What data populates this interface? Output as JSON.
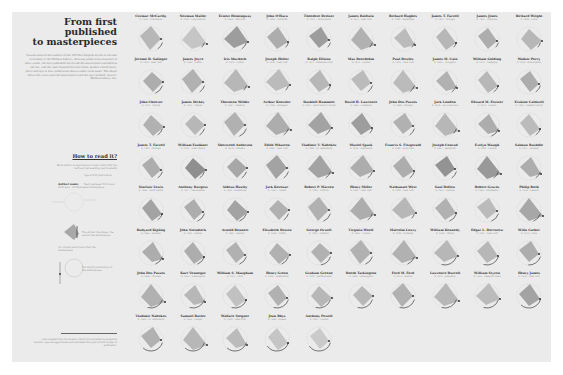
{
  "sidebar": {
    "title": [
      "From first",
      "published",
      "to masterpieces"
    ],
    "intro": "Visualization of the authors of the 100 best English novels of all time according to the Modern Library, showing publication sequence of their works, the first published novel and the masterpiece included in the list, and the time elapsed between them. Author's birth dates, place and age at first publication shown under each name. The shape shows the years until the masterpiece and the age reached. Source: Modern Library list.",
    "how_to_read": "How to read it?",
    "legend": {
      "caption": "Each author is depicted by a radar chart with the vertices representing key moments",
      "author_name_label": "Author name",
      "author_sub_label": "birth year · birthplace",
      "age_label": "Age at first publication",
      "years_label": "Years between first novel and masterpiece",
      "shape_caption": "The darker the shape, the earlier the masterpiece",
      "arc_caption": "Arc shows years lived after the masterpiece",
      "dot_caption": "Dot marks publication of the masterpiece"
    },
    "footnote": "Data compiled from the Modern Library list and public biographical records. Ages are approximate and calculated from year of birth to year of publication."
  },
  "colors": {
    "background": "#ffffff",
    "panel": "#ebebeb",
    "shape_light": "#c9c9c9",
    "shape_dark": "#8f8f8f",
    "line": "#555555",
    "text": "#333333",
    "muted": "#8a8a8a"
  },
  "authors": [
    {
      "name": "Cormac McCarthy",
      "sub": "b. 1933 · Providence",
      "shade": 0.35,
      "arc": 0.15
    },
    {
      "name": "Norman Mailer",
      "sub": "b. 1923 · Long Branch",
      "shade": 0.2,
      "arc": 0.1
    },
    {
      "name": "Ernest Hemingway",
      "sub": "b. 1899 · Oak Park",
      "shade": 0.6,
      "arc": 0.15
    },
    {
      "name": "John O'Hara",
      "sub": "b. 1905 · Pottsville",
      "shade": 0.45,
      "arc": 0.1
    },
    {
      "name": "Theodore Dreiser",
      "sub": "b. 1871 · Terre Haute",
      "shade": 0.6,
      "arc": 0.1
    },
    {
      "name": "James Baldwin",
      "sub": "b. 1924 · New York",
      "shade": 0.4,
      "arc": 0.1
    },
    {
      "name": "Richard Hughes",
      "sub": "b. 1900 · Weybridge",
      "shade": 0.3,
      "arc": 0.1
    },
    {
      "name": "James T. Farrell",
      "sub": "b. 1904 · Chicago",
      "shade": 0.35,
      "arc": 0.1
    },
    {
      "name": "James Jones",
      "sub": "b. 1921 · Robinson",
      "shade": 0.45,
      "arc": 0.1
    },
    {
      "name": "Richard Wright",
      "sub": "b. 1908 · Roxie",
      "shade": 0.35,
      "arc": 0.1
    },
    {
      "name": "Jerome D. Salinger",
      "sub": "b. 1919 · New York",
      "shade": 0.45,
      "arc": 0.2
    },
    {
      "name": "James Joyce",
      "sub": "b. 1882 · Dublin",
      "shade": 0.4,
      "arc": 0.15
    },
    {
      "name": "Iris Murdoch",
      "sub": "b. 1919 · Dublin",
      "shade": 0.35,
      "arc": 0.1
    },
    {
      "name": "Joseph Heller",
      "sub": "b. 1923 · New York",
      "shade": 0.3,
      "arc": 0.1
    },
    {
      "name": "Ralph Ellison",
      "sub": "b. 1914 · Oklahoma City",
      "shade": 0.35,
      "arc": 0.1
    },
    {
      "name": "Max Beerbohm",
      "sub": "b. 1872 · London",
      "shade": 0.3,
      "arc": 0.15
    },
    {
      "name": "Paul Bowles",
      "sub": "b. 1910 · New York",
      "shade": 0.3,
      "arc": 0.15
    },
    {
      "name": "James M. Cain",
      "sub": "b. 1892 · Annapolis",
      "shade": 0.4,
      "arc": 0.15
    },
    {
      "name": "William Golding",
      "sub": "b. 1911 · Newquay",
      "shade": 0.35,
      "arc": 0.15
    },
    {
      "name": "Walker Percy",
      "sub": "b. 1916 · Birmingham",
      "shade": 0.45,
      "arc": 0.15
    },
    {
      "name": "John Cheever",
      "sub": "b. 1912 · Quincy",
      "shade": 0.4,
      "arc": 0.15
    },
    {
      "name": "James Dickey",
      "sub": "b. 1923 · Atlanta",
      "shade": 0.35,
      "arc": 0.15
    },
    {
      "name": "Thornton Wilder",
      "sub": "b. 1897 · Madison",
      "shade": 0.4,
      "arc": 0.2
    },
    {
      "name": "Arthur Koestler",
      "sub": "b. 1905 · Budapest",
      "shade": 0.45,
      "arc": 0.15
    },
    {
      "name": "Dashiell Hammett",
      "sub": "b. 1894 · Saint Mary's County",
      "shade": 0.55,
      "arc": 0.15
    },
    {
      "name": "David H. Lawrence",
      "sub": "b. 1885 · Eastwood",
      "shade": 0.6,
      "arc": 0.1
    },
    {
      "name": "John Dos Passos",
      "sub": "b. 1896 · Chicago",
      "shade": 0.4,
      "arc": 0.15
    },
    {
      "name": "Jack London",
      "sub": "b. 1876 · San Francisco",
      "shade": 0.35,
      "arc": 0.1
    },
    {
      "name": "Edward M. Forster",
      "sub": "b. 1879 · London",
      "shade": 0.45,
      "arc": 0.2
    },
    {
      "name": "Erskine Caldwell",
      "sub": "b. 1903 · Coweta County",
      "shade": 0.3,
      "arc": 0.15
    },
    {
      "name": "James T. Farrell",
      "sub": "b. 1904 · Chicago",
      "shade": 0.45,
      "arc": 0.15
    },
    {
      "name": "William Faulkner",
      "sub": "b. 1897 · New Albany",
      "shade": 0.75,
      "arc": 0.15
    },
    {
      "name": "Sherwood Anderson",
      "sub": "b. 1876 · Camden",
      "shade": 0.5,
      "arc": 0.15
    },
    {
      "name": "Edith Wharton",
      "sub": "b. 1862 · New York",
      "shade": 0.55,
      "arc": 0.15
    },
    {
      "name": "Vladimir V. Nabokov",
      "sub": "b. 1899 · St. Petersburg",
      "shade": 0.55,
      "arc": 0.15
    },
    {
      "name": "Muriel Spark",
      "sub": "b. 1918 · Edinburgh",
      "shade": 0.45,
      "arc": 0.15
    },
    {
      "name": "Francis S. Fitzgerald",
      "sub": "b. 1896 · Saint Paul",
      "shade": 0.45,
      "arc": 0.15
    },
    {
      "name": "Joseph Conrad",
      "sub": "b. 1857 · Berdychiv",
      "shade": 0.7,
      "arc": 0.15
    },
    {
      "name": "Evelyn Waugh",
      "sub": "b. 1903 · London",
      "shade": 0.65,
      "arc": 0.15
    },
    {
      "name": "Salman Rushdie",
      "sub": "b. 1947 · Bombay",
      "shade": 0.45,
      "arc": 0.15
    },
    {
      "name": "Sinclair Lewis",
      "sub": "b. 1885 · Sauk Centre",
      "shade": 0.55,
      "arc": 0.15
    },
    {
      "name": "Anthony Burgess",
      "sub": "b. 1917 · Manchester",
      "shade": 0.45,
      "arc": 0.2
    },
    {
      "name": "Aldous Huxley",
      "sub": "b. 1894 · Godalming",
      "shade": 0.55,
      "arc": 0.2
    },
    {
      "name": "Jack Kerouac",
      "sub": "b. 1922 · Lowell",
      "shade": 0.4,
      "arc": 0.15
    },
    {
      "name": "Robert P. Warren",
      "sub": "b. 1905 · Guthrie",
      "shade": 0.4,
      "arc": 0.2
    },
    {
      "name": "Henry Miller",
      "sub": "b. 1891 · New York",
      "shade": 0.45,
      "arc": 0.15
    },
    {
      "name": "Nathanael West",
      "sub": "b. 1903 · New York",
      "shade": 0.35,
      "arc": 0.1
    },
    {
      "name": "Saul Bellow",
      "sub": "b. 1915 · Lachine",
      "shade": 0.4,
      "arc": 0.2
    },
    {
      "name": "Robert Graves",
      "sub": "b. 1895 · Wimbledon",
      "shade": 0.3,
      "arc": 0.2
    },
    {
      "name": "Philip Roth",
      "sub": "b. 1933 · Newark",
      "shade": 0.5,
      "arc": 0.2
    },
    {
      "name": "Rudyard Kipling",
      "sub": "b. 1865 · Bombay",
      "shade": 0.45,
      "arc": 0.2
    },
    {
      "name": "John Steinbeck",
      "sub": "b. 1902 · Salinas",
      "shade": 0.45,
      "arc": 0.2
    },
    {
      "name": "Arnold Bennett",
      "sub": "b. 1867 · Hanley",
      "shade": 0.4,
      "arc": 0.2
    },
    {
      "name": "Elizabeth Bowen",
      "sub": "b. 1899 · Dublin",
      "shade": 0.4,
      "arc": 0.2
    },
    {
      "name": "George Orwell",
      "sub": "b. 1903 · Motihari",
      "shade": 0.4,
      "arc": 0.25
    },
    {
      "name": "Virginia Woolf",
      "sub": "b. 1882 · London",
      "shade": 0.4,
      "arc": 0.2
    },
    {
      "name": "Malcolm Lowry",
      "sub": "b. 1909 · Wallasey",
      "shade": 0.4,
      "arc": 0.2
    },
    {
      "name": "William Kennedy",
      "sub": "b. 1928 · Albany",
      "shade": 0.35,
      "arc": 0.35
    },
    {
      "name": "Edgar L. Doctorow",
      "sub": "b. 1931 · New York",
      "shade": 0.35,
      "arc": 0.35
    },
    {
      "name": "Willa Cather",
      "sub": "b. 1873 · Gore",
      "shade": 0.45,
      "arc": 0.3
    },
    {
      "name": "John Dos Passos",
      "sub": "b. 1896 · Chicago",
      "shade": 0.4,
      "arc": 0.35
    },
    {
      "name": "Kurt Vonnegut",
      "sub": "b. 1922 · Indianapolis",
      "shade": 0.35,
      "arc": 0.35
    },
    {
      "name": "William S. Maugham",
      "sub": "b. 1874 · Paris",
      "shade": 0.25,
      "arc": 0.35
    },
    {
      "name": "Henry Green",
      "sub": "b. 1905 · Tewkesbury",
      "shade": 0.4,
      "arc": 0.35
    },
    {
      "name": "Graham Greene",
      "sub": "b. 1904 · Berkhamsted",
      "shade": 0.35,
      "arc": 0.35
    },
    {
      "name": "Booth Tarkington",
      "sub": "b. 1869 · Indianapolis",
      "shade": 0.35,
      "arc": 0.35
    },
    {
      "name": "Ford M. Ford",
      "sub": "b. 1873 · Merton",
      "shade": 0.4,
      "arc": 0.35
    },
    {
      "name": "Lawrence Durrell",
      "sub": "b. 1912 · Jalandhar",
      "shade": 0.35,
      "arc": 0.35
    },
    {
      "name": "William Styron",
      "sub": "b. 1925 · Newport News",
      "shade": 0.3,
      "arc": 0.35
    },
    {
      "name": "Henry James",
      "sub": "b. 1843 · New York",
      "shade": 0.55,
      "arc": 0.45
    },
    {
      "name": "Vladimir Nabokov",
      "sub": "b. 1899 · St. Petersburg",
      "shade": 0.4,
      "arc": 0.45
    },
    {
      "name": "Samuel Butler",
      "sub": "b. 1835 · Langar",
      "shade": 0.35,
      "arc": 0.45
    },
    {
      "name": "Wallace Stegner",
      "sub": "b. 1909 · Lake Mills",
      "shade": 0.3,
      "arc": 0.45
    },
    {
      "name": "Jean Rhys",
      "sub": "b. 1890 · Roseau",
      "shade": 0.2,
      "arc": 0.5
    },
    {
      "name": "Anthony Powell",
      "sub": "b. 1905 · London",
      "shade": 0.15,
      "arc": 0.5
    }
  ]
}
